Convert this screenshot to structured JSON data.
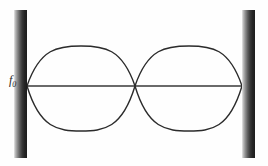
{
  "figure": {
    "background_color": "#fefefe",
    "width": 268,
    "height": 166
  },
  "labels": {
    "frequency_symbol": "f",
    "frequency_subscript": "0"
  },
  "walls": {
    "left": {
      "name": "left-wall",
      "x": 14,
      "y": 10,
      "width": 13,
      "height": 148
    },
    "right": {
      "name": "right-wall",
      "x": 242,
      "y": 10,
      "width": 13,
      "height": 148
    },
    "gradient_light": "#e8e8e8",
    "gradient_dark": "#1d1d1d"
  },
  "chart_data": {
    "type": "line",
    "xlabel": "",
    "ylabel": "",
    "grid": false,
    "legend": null,
    "axis_line": {
      "name": "equilibrium-axis",
      "x_start": 27,
      "x_end": 242,
      "y": 86,
      "color": "#6a6a6a",
      "width": 2
    },
    "curve_color": "#2b2b2b",
    "curve_width": 1.4,
    "nodes": [
      {
        "label": "node-left",
        "x": 27,
        "y": 86
      },
      {
        "label": "node-center",
        "x": 135,
        "y": 86
      },
      {
        "label": "node-right",
        "x": 242,
        "y": 86
      }
    ],
    "antinodes": [
      {
        "label": "antinode-1",
        "x": 81,
        "y_top": 46,
        "y_bottom": 131
      },
      {
        "label": "antinode-2",
        "x": 189,
        "y_top": 46,
        "y_bottom": 131
      }
    ],
    "harmonic_number": 2,
    "loops": 2,
    "amplitude_px": 40,
    "series": [
      {
        "name": "upper-envelope",
        "path": "M 27 86 Q 54 46 81 46 Q 108 46 135 86 Q 162 46 189 46 Q 216 46 242 86"
      },
      {
        "name": "lower-envelope",
        "path": "M 27 86 Q 54 131 81 131 Q 108 131 135 86 Q 162 131 189 131 Q 216 131 242 86"
      }
    ]
  }
}
